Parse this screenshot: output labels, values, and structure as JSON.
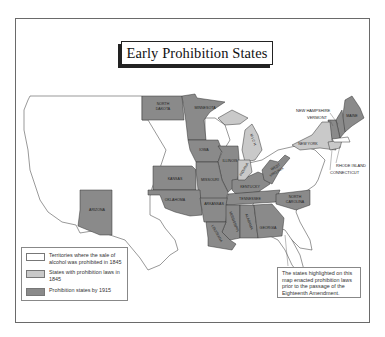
{
  "title": "Early Prohibition States",
  "colors": {
    "territory_1845": "#ffffff",
    "states_1845": "#c9c9c9",
    "states_1915": "#8a8a8a",
    "outline": "#333333",
    "frame": "#6a6a6a"
  },
  "states": {
    "north_dakota": {
      "label_line1": "NORTH",
      "label_line2": "DAKOTA",
      "category": "1915"
    },
    "minnesota": {
      "label": "MINNESOTA",
      "category": "1915"
    },
    "iowa": {
      "label": "IOWA",
      "category": "1915"
    },
    "illinois": {
      "label": "ILLINOIS",
      "category": "1915"
    },
    "michigan": {
      "label": "M I C H",
      "category": "1845"
    },
    "indiana": {
      "label": "INDIANA",
      "category": "1845"
    },
    "kansas": {
      "label": "KANSAS",
      "category": "1915"
    },
    "missouri": {
      "label": "MISSOURI",
      "category": "1915"
    },
    "kentucky": {
      "label": "KENTUCKY",
      "category": "1915"
    },
    "west_virginia": {
      "label_line1": "WEST",
      "label_line2": "VIRGINIA",
      "category": "1915"
    },
    "oklahoma": {
      "label": "OKLAHOMA",
      "category": "1915"
    },
    "arkansas": {
      "label": "ARKANSAS",
      "category": "1915"
    },
    "tennessee": {
      "label": "TENNESSEE",
      "category": "1915"
    },
    "north_carolina": {
      "label_line1": "NORTH",
      "label_line2": "CAROLINA",
      "category": "1915"
    },
    "mississippi": {
      "label": "MISSISSIPPI",
      "category": "1915"
    },
    "alabama": {
      "label": "ALABAMA",
      "category": "1915"
    },
    "georgia": {
      "label": "GEORGIA",
      "category": "1915"
    },
    "louisiana": {
      "label": "LOUISIANA",
      "category": "1915"
    },
    "arizona": {
      "label": "ARIZONA",
      "category": "1915"
    },
    "new_york": {
      "label": "NEW YORK",
      "category": "1845"
    },
    "maine": {
      "label": "MAINE",
      "category": "1915"
    },
    "new_hampshire": {
      "label": "NEW HAMPSHIRE",
      "category": "1915"
    },
    "vermont": {
      "label": "VERMONT",
      "category": "1915"
    },
    "rhode_island": {
      "label": "RHODE ISLAND",
      "category": "1845"
    },
    "connecticut": {
      "label": "CONNECTICUT",
      "category": "1845"
    }
  },
  "legend": {
    "items": [
      {
        "label": "Territories where the sale of alcohol was prohibited in 1845",
        "swatch": "#ffffff"
      },
      {
        "label": "States with prohibition laws in 1845",
        "swatch": "#c9c9c9"
      },
      {
        "label": "Prohibition states by 1915",
        "swatch": "#8a8a8a"
      }
    ]
  },
  "note": "The states highlighted on this map enacted prohibition laws prior to the passage of the Eighteenth Amendment."
}
